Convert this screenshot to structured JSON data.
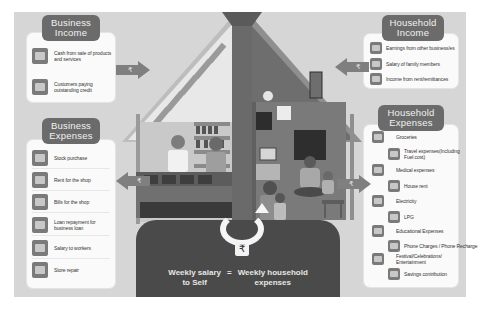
{
  "business_income": {
    "title_line1": "Business",
    "title_line2": "Income",
    "items": [
      {
        "icon": "cash-bundle-icon",
        "line1": "Cash from sale of products",
        "line2": "and services"
      },
      {
        "icon": "cash-bundle-icon",
        "line1": "Customers paying",
        "line2": "outstanding credit"
      }
    ]
  },
  "business_expenses": {
    "title_line1": "Business",
    "title_line2": "Expenses",
    "items": [
      {
        "icon": "shopping-bag-icon",
        "line1": "Stock purchase",
        "line2": ""
      },
      {
        "icon": "shop-icon",
        "line1": "Rent for the shop",
        "line2": ""
      },
      {
        "icon": "bill-icon",
        "line1": "Bills for the shop",
        "line2": ""
      },
      {
        "icon": "bank-icon",
        "line1": "Loan repayment for",
        "line2": "business loan"
      },
      {
        "icon": "cash-bundle-icon",
        "line1": "Salary to workers",
        "line2": ""
      },
      {
        "icon": "tools-icon",
        "line1": "Store repair",
        "line2": ""
      }
    ]
  },
  "household_income": {
    "title_line1": "Household",
    "title_line2": "Income",
    "items": [
      {
        "icon": "checkmark-icon",
        "line1": "Earnings from other business/es"
      },
      {
        "icon": "money-hand-icon",
        "line1": "Salary of family members"
      },
      {
        "icon": "handshake-icon",
        "line1": "Income from rent/remittances"
      }
    ]
  },
  "household_expenses": {
    "title_line1": "Household",
    "title_line2": "Expenses",
    "items": [
      {
        "icon": "grocery-basket-icon",
        "line1": "Groceries",
        "line2": ""
      },
      {
        "icon": "bus-icon",
        "line1": "Travel expenses(Including",
        "line2": "Fuel cost)"
      },
      {
        "icon": "medical-kit-icon",
        "line1": "Medical expenses",
        "line2": ""
      },
      {
        "icon": "house-icon",
        "line1": "House rent",
        "line2": ""
      },
      {
        "icon": "electricity-icon",
        "line1": "Electricity",
        "line2": ""
      },
      {
        "icon": "gas-cylinder-icon",
        "line1": "LPG",
        "line2": ""
      },
      {
        "icon": "education-icon",
        "line1": "Educational Expenses",
        "line2": ""
      },
      {
        "icon": "phone-icon",
        "line1": "Phone Charges / Phone Recharge",
        "line2": ""
      },
      {
        "icon": "festival-icon",
        "line1": "Festival/Celebrations/",
        "line2": "Entertainment"
      },
      {
        "icon": "piggy-bank-icon",
        "line1": "Savings contribution",
        "line2": ""
      }
    ]
  },
  "arrows": {
    "symbol": "₹"
  },
  "formula": {
    "left_line1": "Weekly salary",
    "left_line2": "to Self",
    "equals": "=",
    "right_line1": "Weekly household",
    "right_line2": "expenses",
    "badge_symbol": "₹"
  },
  "colors": {
    "background": "#d6d6d6",
    "panel": "#fafafa",
    "title_badge": "#6b6b6b",
    "arrow": "#7f7f7f",
    "house_dark": "#4a4a4a"
  }
}
